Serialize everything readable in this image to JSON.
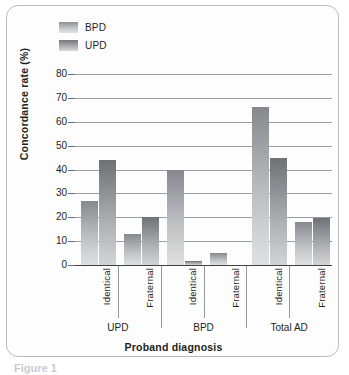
{
  "figure": {
    "caption_fragment": "Figure 1"
  },
  "legend": {
    "position": "top-left",
    "items": [
      {
        "label": "BPD",
        "swatch": "legend-swatch-bpd",
        "color": "#a8abaf"
      },
      {
        "label": "UPD",
        "swatch": "legend-swatch-upd",
        "color": "#8f9296"
      }
    ]
  },
  "chart_data": {
    "type": "bar",
    "title": "",
    "xlabel": "Proband diagnosis",
    "ylabel": "Concordance rate (%)",
    "ylim": [
      0,
      80
    ],
    "yticks": [
      0,
      10,
      20,
      30,
      40,
      50,
      60,
      70,
      80
    ],
    "ytick_labels": [
      "0",
      "10",
      "20",
      "30",
      "40",
      "50",
      "60",
      "70",
      "80"
    ],
    "grid": true,
    "legend_position": "top-left",
    "categories": [
      "Identical",
      "Fraternal",
      "Identical",
      "Fraternal",
      "Identical",
      "Fraternal"
    ],
    "groups": [
      {
        "label": "UPD",
        "categories": [
          "Identical",
          "Fraternal"
        ]
      },
      {
        "label": "BPD",
        "categories": [
          "Identical",
          "Fraternal"
        ]
      },
      {
        "label": "Total AD",
        "categories": [
          "Identical",
          "Fraternal"
        ]
      }
    ],
    "series": [
      {
        "name": "BPD",
        "values": [
          27,
          13,
          40,
          5,
          66,
          18
        ]
      },
      {
        "name": "UPD",
        "values": [
          44,
          20,
          1.5,
          0,
          45,
          19.5
        ]
      }
    ]
  }
}
